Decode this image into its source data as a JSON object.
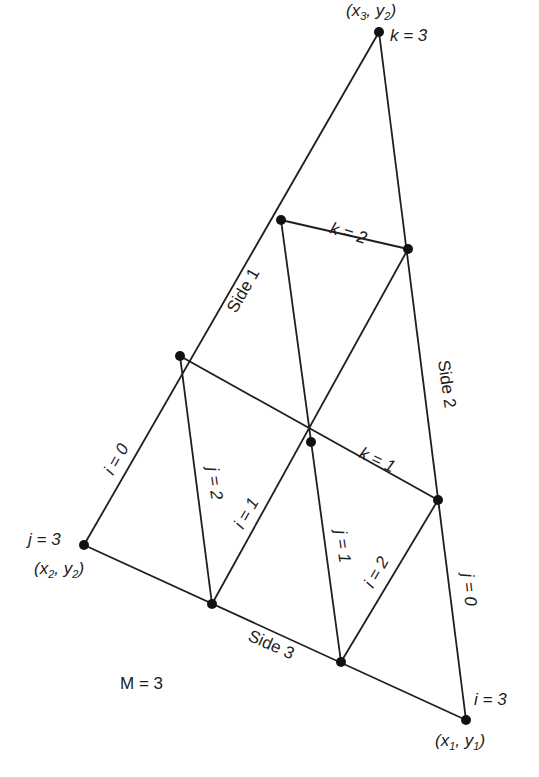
{
  "figure": {
    "M_label": "M = 3",
    "colors": {
      "line": "#1e1e1e",
      "node": "#111111",
      "text": "#1c1c1c",
      "background": "#ffffff"
    }
  },
  "vertices": {
    "v1": {
      "label": "(x1, y1)",
      "base": "(x",
      "sub1": "1",
      "mid": ", y",
      "sub2": "1",
      "close": ")",
      "index_label": "i = 3"
    },
    "v2": {
      "label": "(x2, y2)",
      "base": "(x",
      "sub1": "2",
      "mid": ", y",
      "sub2": "2",
      "close": ")",
      "index_label": "j = 3"
    },
    "v3": {
      "label": "(x3, y2)",
      "base": "(x",
      "sub1": "3",
      "mid": ", y",
      "sub2": "2",
      "close": ")",
      "index_label": "k = 3"
    }
  },
  "sides": {
    "side1": "Side 1",
    "side2": "Side 2",
    "side3": "Side 3"
  },
  "line_labels": {
    "k2": "k = 2",
    "k1": "k = 1",
    "i0": "i = 0",
    "j2": "j = 2",
    "i1_left": "i = 1",
    "j1": "j = 1",
    "i2": "i = 2",
    "j0": "j = 0"
  },
  "nodes": [
    {
      "id": "n_top",
      "x": 379,
      "y": 32
    },
    {
      "id": "n_s1a",
      "x": 281,
      "y": 220
    },
    {
      "id": "n_s2a",
      "x": 408,
      "y": 249
    },
    {
      "id": "n_s1b",
      "x": 180,
      "y": 356
    },
    {
      "id": "n_center",
      "x": 311,
      "y": 442
    },
    {
      "id": "n_s2b",
      "x": 438,
      "y": 500
    },
    {
      "id": "n_left",
      "x": 84,
      "y": 545
    },
    {
      "id": "n_s3a",
      "x": 212,
      "y": 604
    },
    {
      "id": "n_s3b",
      "x": 341,
      "y": 662
    },
    {
      "id": "n_right",
      "x": 466,
      "y": 720
    }
  ]
}
